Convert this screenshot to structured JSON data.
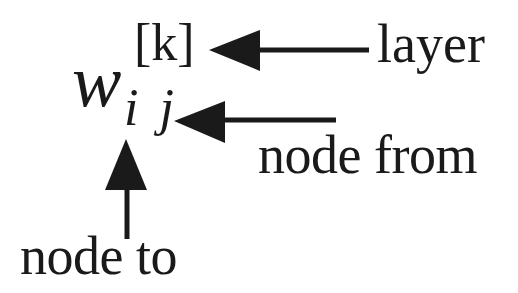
{
  "diagram": {
    "notation": {
      "base": "w",
      "superscript": "[k]",
      "subscript": "i j"
    },
    "labels": {
      "layer": "layer",
      "node_from": "node from",
      "node_to": "node to"
    },
    "arrows": [
      {
        "points_to": "superscript [k]",
        "from_label": "layer",
        "direction": "left"
      },
      {
        "points_to": "subscript j",
        "from_label": "node from",
        "direction": "left"
      },
      {
        "points_to": "subscript i",
        "from_label": "node to",
        "direction": "up"
      }
    ],
    "colors": {
      "ink": "#1a1a1a",
      "background": "#ffffff"
    }
  }
}
